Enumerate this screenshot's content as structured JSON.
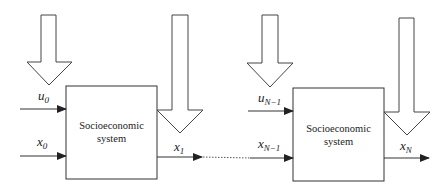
{
  "diagram": {
    "stages": [
      {
        "box_label_line1": "Socioeconomic",
        "box_label_line2": "system",
        "control_input": {
          "base": "u",
          "sub": "0"
        },
        "state_input": {
          "base": "x",
          "sub": "0"
        },
        "state_output": {
          "base": "x",
          "sub": "1"
        }
      },
      {
        "box_label_line1": "Socioeconomic",
        "box_label_line2": "system",
        "control_input": {
          "base": "u",
          "sub": "N−1"
        },
        "state_input": {
          "base": "x",
          "sub": "N−1"
        },
        "state_output": {
          "base": "x",
          "sub": "N"
        }
      }
    ],
    "colors": {
      "stroke": "#333333",
      "background": "#ffffff"
    }
  }
}
